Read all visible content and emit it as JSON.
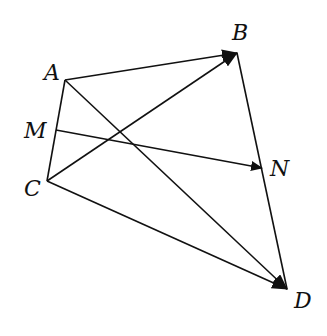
{
  "figure": {
    "type": "vector-quadrilateral",
    "points": {
      "A": {
        "label": "A",
        "x": 65,
        "y": 80,
        "label_x": 44,
        "label_y": 80
      },
      "B": {
        "label": "B",
        "x": 237,
        "y": 53,
        "label_x": 232,
        "label_y": 40
      },
      "M": {
        "label": "M",
        "x": 56,
        "y": 130,
        "label_x": 24,
        "label_y": 138
      },
      "N": {
        "label": "N",
        "x": 262,
        "y": 168,
        "label_x": 270,
        "label_y": 176
      },
      "C": {
        "label": "C",
        "x": 47,
        "y": 181,
        "label_x": 24,
        "label_y": 196
      },
      "D": {
        "label": "D",
        "x": 287,
        "y": 289,
        "label_x": 294,
        "label_y": 308
      }
    },
    "segments": [
      {
        "from": "A",
        "to": "C",
        "arrow": false
      },
      {
        "from": "B",
        "to": "D",
        "arrow": false
      }
    ],
    "vectors": [
      {
        "from": "A",
        "to": "B",
        "arrow": true
      },
      {
        "from": "C",
        "to": "B",
        "arrow": true
      },
      {
        "from": "A",
        "to": "D",
        "arrow": true
      },
      {
        "from": "C",
        "to": "D",
        "arrow": true
      },
      {
        "from": "M",
        "to": "N",
        "arrow": true
      }
    ],
    "stroke_color": "#111111"
  }
}
